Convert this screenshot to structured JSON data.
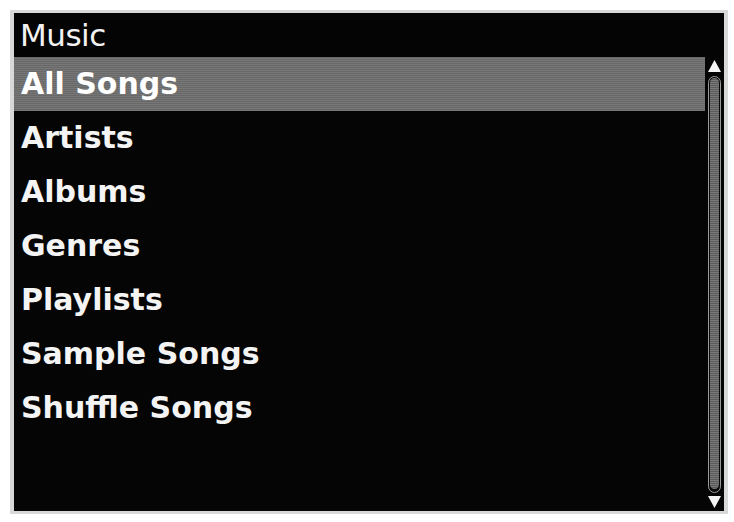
{
  "screen": {
    "title": "Music",
    "background_color": "#050505",
    "text_color": "#f4f4f4",
    "highlight_color": "#6f6f6f"
  },
  "menu": {
    "items": [
      {
        "label": "All Songs",
        "selected": true
      },
      {
        "label": "Artists",
        "selected": false
      },
      {
        "label": "Albums",
        "selected": false
      },
      {
        "label": "Genres",
        "selected": false
      },
      {
        "label": "Playlists",
        "selected": false
      },
      {
        "label": "Sample Songs",
        "selected": false
      },
      {
        "label": "Shuffle Songs",
        "selected": false
      }
    ]
  },
  "scrollbar": {
    "up_arrow_icon": "triangle-up-icon",
    "down_arrow_icon": "triangle-down-icon",
    "thumb_color": "#6a6a6a",
    "track_color": "#0a0a0a"
  }
}
